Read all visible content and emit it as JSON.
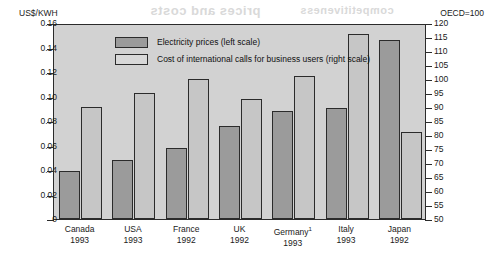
{
  "axes": {
    "left_unit": "US$/KWH",
    "right_unit": "OECD=100",
    "left_ticks": [
      "0.16",
      "0.14",
      "0.12",
      "0.10",
      "0.08",
      "0.06",
      "0.04",
      "0.02",
      "0"
    ],
    "right_ticks": [
      "120",
      "115",
      "110",
      "105",
      "100",
      "95",
      "90",
      "85",
      "80",
      "75",
      "70",
      "65",
      "60",
      "55",
      "50"
    ]
  },
  "legend": {
    "items": [
      {
        "label": "Electricity prices (left scale)",
        "swatch": "dark"
      },
      {
        "label": "Cost of international calls for business users (right scale)",
        "swatch": "light"
      }
    ]
  },
  "categories": [
    {
      "name": "Canada",
      "year": "1993",
      "footnote": ""
    },
    {
      "name": "USA",
      "year": "1993",
      "footnote": ""
    },
    {
      "name": "France",
      "year": "1992",
      "footnote": ""
    },
    {
      "name": "UK",
      "year": "1992",
      "footnote": ""
    },
    {
      "name": "Germany",
      "year": "1993",
      "footnote": "1"
    },
    {
      "name": "Italy",
      "year": "1993",
      "footnote": ""
    },
    {
      "name": "Japan",
      "year": "1992",
      "footnote": ""
    }
  ],
  "colors": {
    "plot_background": "#d2d2d2",
    "bar_dark": "#9b9b9b",
    "bar_light": "#c6c6c6",
    "outline": "#2b2b2b",
    "page_background": "#ffffff"
  },
  "bleed_through": {
    "line1": "prices and costs",
    "line2": "competitiveness",
    "line3": "indicators"
  },
  "chart_data": {
    "type": "bar",
    "title": "",
    "xlabel": "",
    "ylabel": "US$/KWH",
    "y2label": "OECD=100",
    "ylim": [
      0,
      0.16
    ],
    "y2lim": [
      50,
      120
    ],
    "grid": false,
    "legend_position": "top-left",
    "categories": [
      "Canada 1993",
      "USA 1993",
      "France 1992",
      "UK 1992",
      "Germany 1993",
      "Italy 1993",
      "Japan 1992"
    ],
    "series": [
      {
        "name": "Electricity prices (left scale)",
        "axis": "left",
        "unit": "US$/KWH",
        "values": [
          0.039,
          0.048,
          0.058,
          0.076,
          0.088,
          0.091,
          0.146
        ]
      },
      {
        "name": "Cost of international calls for business users (right scale)",
        "axis": "right",
        "unit": "OECD=100",
        "values": [
          90,
          95,
          100,
          93,
          101,
          116,
          81
        ]
      }
    ]
  }
}
